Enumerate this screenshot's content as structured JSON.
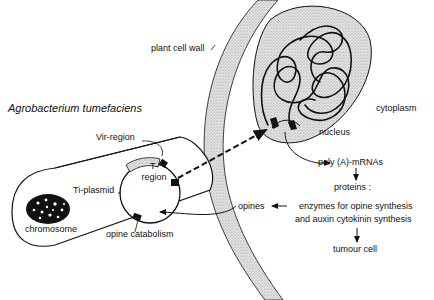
{
  "diagram": {
    "title": "Agrobacterium tumefaciens",
    "labels": {
      "plant_cell_wall": "plant cell wall",
      "cytoplasm": "cytoplasm",
      "nucleus": "nucleus",
      "vir_region": "Vir-region",
      "t_region_line1": "T-",
      "t_region_line2": "region",
      "ti_plasmid": "Ti-plasmid",
      "chromosome": "chromosome",
      "opine_catabolism": "opine catabolism",
      "opines": "opines",
      "poly_a_mrnas": "poly (A)-mRNAs",
      "proteins": "proteins :",
      "enzymes_line1": "enzymes for opine synthesis",
      "enzymes_line2": "and auxin cytokinin synthesis",
      "tumour_cell": "tumour cell"
    },
    "colors": {
      "ink": "#111111",
      "stipple": "#c8c8c8",
      "background": "#ffffff"
    },
    "flow": [
      "T-region transferred to nucleus",
      "nucleus -> poly (A)-mRNAs",
      "poly (A)-mRNAs -> proteins",
      "proteins -> tumour cell",
      "enzymes -> opines -> opine catabolism"
    ]
  }
}
